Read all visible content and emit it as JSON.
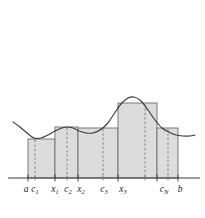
{
  "colors": {
    "curve": "#3b3b3b",
    "bar_fill": "#dcdcdc",
    "bar_stroke": "#6e6e6e",
    "axis": "#3b3b3b",
    "dashed": "#7a7a7a",
    "label_text": "#1a1a1a",
    "background": "#ffffff"
  },
  "chart_data": {
    "type": "area",
    "title": "",
    "xlabel": "",
    "ylabel": "",
    "xlim": [
      13,
      195
    ],
    "ylim": [
      178,
      90
    ],
    "grid": false,
    "legend": null,
    "axis": {
      "baseline_y": 178,
      "x_start": 8,
      "x_end": 200
    },
    "curve": {
      "name": "f(x)",
      "points": [
        [
          13,
          122
        ],
        [
          20,
          127
        ],
        [
          27,
          133
        ],
        [
          34,
          138
        ],
        [
          41,
          138
        ],
        [
          48,
          135
        ],
        [
          55,
          131
        ],
        [
          62,
          128
        ],
        [
          67,
          127
        ],
        [
          73,
          128
        ],
        [
          79,
          131
        ],
        [
          86,
          133
        ],
        [
          93,
          133
        ],
        [
          100,
          130
        ],
        [
          107,
          124
        ],
        [
          114,
          114
        ],
        [
          121,
          104
        ],
        [
          128,
          98
        ],
        [
          134,
          97
        ],
        [
          141,
          101
        ],
        [
          148,
          110
        ],
        [
          155,
          120
        ],
        [
          162,
          128
        ],
        [
          169,
          132
        ],
        [
          176,
          135
        ],
        [
          183,
          136
        ],
        [
          190,
          136
        ],
        [
          195,
          135
        ]
      ]
    },
    "bars": [
      {
        "index": 1,
        "label": "c1",
        "x_left": 28,
        "x_right": 55,
        "sample_x": 35,
        "top_y": 139,
        "height": 39
      },
      {
        "index": 2,
        "label": "c2",
        "x_left": 55,
        "x_right": 78,
        "sample_x": 67,
        "top_y": 127,
        "height": 51
      },
      {
        "index": 3,
        "label": "c3",
        "x_left": 78,
        "x_right": 118,
        "sample_x": 103,
        "top_y": 128,
        "height": 50
      },
      {
        "index": 4,
        "label": "c4",
        "x_left": 118,
        "x_right": 157,
        "sample_x": 145,
        "top_y": 103,
        "height": 75
      },
      {
        "index": 5,
        "label": "cN",
        "x_left": 157,
        "x_right": 178,
        "sample_x": 168,
        "top_y": 128,
        "height": 50
      }
    ],
    "partition_ticks": [
      {
        "x": 28,
        "label": "a"
      },
      {
        "x": 55,
        "label": "x1"
      },
      {
        "x": 78,
        "label": "x2"
      },
      {
        "x": 118,
        "label": "x3"
      },
      {
        "x": 157,
        "label": ""
      },
      {
        "x": 178,
        "label": "b"
      }
    ],
    "sample_ticks": [
      {
        "x": 35,
        "label": "c1"
      },
      {
        "x": 67,
        "label": "c2"
      },
      {
        "x": 103,
        "label": "c3"
      },
      {
        "x": 145,
        "label": ""
      },
      {
        "x": 168,
        "label": "cN"
      }
    ]
  },
  "labels": [
    {
      "id": "label-a",
      "base": "a",
      "sub": "",
      "x": 26,
      "y": 192
    },
    {
      "id": "label-c1",
      "base": "c",
      "sub": "1",
      "x": 35,
      "y": 192
    },
    {
      "id": "label-x1",
      "base": "x",
      "sub": "1",
      "x": 55,
      "y": 192
    },
    {
      "id": "label-c2",
      "base": "c",
      "sub": "2",
      "x": 68,
      "y": 192
    },
    {
      "id": "label-x2",
      "base": "x",
      "sub": "2",
      "x": 81,
      "y": 192
    },
    {
      "id": "label-c3",
      "base": "c",
      "sub": "3",
      "x": 104,
      "y": 192
    },
    {
      "id": "label-x3",
      "base": "x",
      "sub": "3",
      "x": 123,
      "y": 192
    },
    {
      "id": "label-cN",
      "base": "c",
      "sub": "N",
      "x": 164,
      "y": 192
    },
    {
      "id": "label-b",
      "base": "b",
      "sub": "",
      "x": 180,
      "y": 192
    }
  ]
}
